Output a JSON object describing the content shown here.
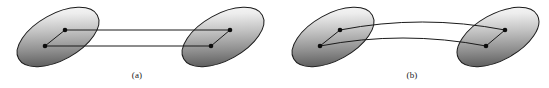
{
  "figure": {
    "background_color": "#ffffff",
    "stroke_color": "#1a1a1a",
    "vertex_color": "#0d0d0d",
    "blob_dark_color": "#4a4a4a",
    "blob_light_color": "#ffffff",
    "width": 549,
    "height": 88
  },
  "panels": [
    {
      "id": "panel-a",
      "caption": "(a)",
      "connector_style": "straight",
      "blobs": [
        {
          "id": "panel-a-left-blob",
          "cx": 58,
          "cy": 37,
          "rx": 45,
          "ry": 23,
          "rotation": -29,
          "vertices": [
            {
              "id": "a-l-top",
              "x": 65,
              "y": 30
            },
            {
              "id": "a-l-bottom",
              "x": 45,
              "y": 46
            }
          ]
        },
        {
          "id": "panel-a-right-blob",
          "cx": 223,
          "cy": 37,
          "rx": 45,
          "ry": 23,
          "rotation": -29,
          "vertices": [
            {
              "id": "a-r-top",
              "x": 230,
              "y": 30
            },
            {
              "id": "a-r-bottom",
              "x": 211,
              "y": 46
            }
          ]
        }
      ],
      "inner_edges": [
        {
          "from": "a-l-top",
          "to": "a-l-bottom"
        },
        {
          "from": "a-r-top",
          "to": "a-r-bottom"
        }
      ],
      "connectors": [
        {
          "from": "a-l-top",
          "to": "a-r-top",
          "curved": false
        },
        {
          "from": "a-l-bottom",
          "to": "a-r-bottom",
          "curved": false
        }
      ]
    },
    {
      "id": "panel-b",
      "caption": "(b)",
      "connector_style": "curved",
      "blobs": [
        {
          "id": "panel-b-left-blob",
          "cx": 333,
          "cy": 37,
          "rx": 45,
          "ry": 23,
          "rotation": -29,
          "vertices": [
            {
              "id": "b-l-top",
              "x": 340,
              "y": 30
            },
            {
              "id": "b-l-bottom",
              "x": 320,
              "y": 46
            }
          ]
        },
        {
          "id": "panel-b-right-blob",
          "cx": 498,
          "cy": 37,
          "rx": 45,
          "ry": 23,
          "rotation": -29,
          "vertices": [
            {
              "id": "b-r-top",
              "x": 505,
              "y": 30
            },
            {
              "id": "b-r-bottom",
              "x": 486,
              "y": 46
            }
          ]
        }
      ],
      "inner_edges": [
        {
          "from": "b-l-top",
          "to": "b-l-bottom"
        },
        {
          "from": "b-r-top",
          "to": "b-r-bottom"
        }
      ],
      "connectors": [
        {
          "from": "b-l-top",
          "to": "b-r-top",
          "curved": true,
          "control_y": 14
        },
        {
          "from": "b-l-bottom",
          "to": "b-r-bottom",
          "curved": true,
          "control_y": 30
        }
      ]
    }
  ]
}
